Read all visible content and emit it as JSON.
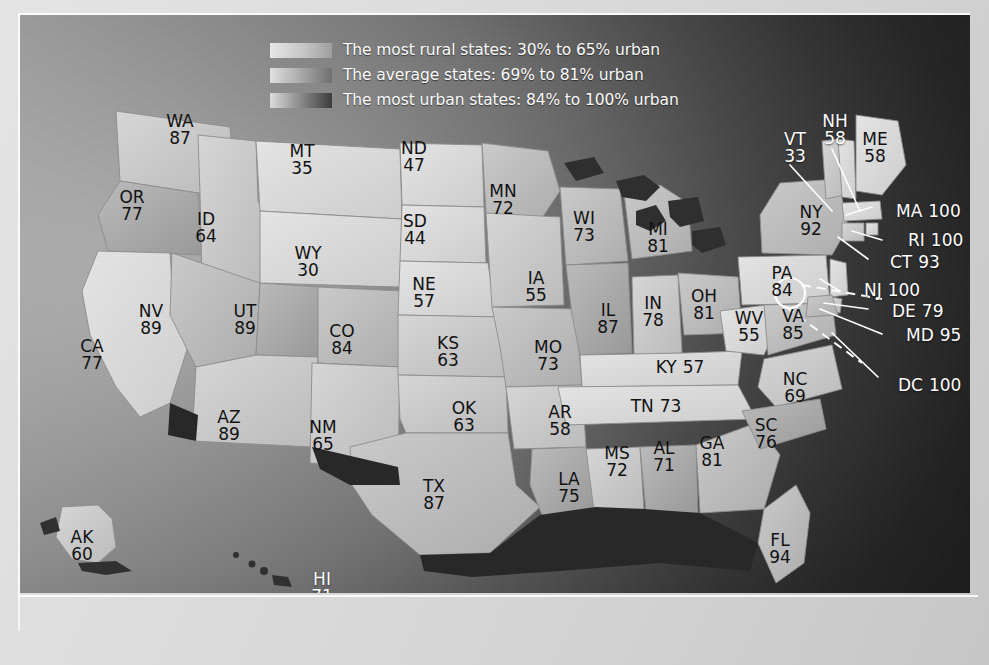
{
  "figure": {
    "type": "choropleth-map"
  },
  "legend": {
    "items": [
      {
        "swatch": "rural-gradient-swatch",
        "label": "The most rural states: 30% to 65% urban"
      },
      {
        "swatch": "average-gradient-swatch",
        "label": "The average states: 69% to 81% urban"
      },
      {
        "swatch": "urban-gradient-swatch",
        "label": "The most urban states: 84% to 100% urban"
      }
    ]
  },
  "states": [
    {
      "code": "WA",
      "value": "87",
      "x": 160,
      "y": 115,
      "style": "stack",
      "color": "dark"
    },
    {
      "code": "OR",
      "value": "77",
      "x": 112,
      "y": 191,
      "style": "stack",
      "color": "dark"
    },
    {
      "code": "ID",
      "value": "64",
      "x": 186,
      "y": 213,
      "style": "stack",
      "color": "dark"
    },
    {
      "code": "MT",
      "value": "35",
      "x": 282,
      "y": 145,
      "style": "stack",
      "color": "dark"
    },
    {
      "code": "WY",
      "value": "30",
      "x": 288,
      "y": 247,
      "style": "stack",
      "color": "dark"
    },
    {
      "code": "NV",
      "value": "89",
      "x": 131,
      "y": 305,
      "style": "stack",
      "color": "dark"
    },
    {
      "code": "UT",
      "value": "89",
      "x": 225,
      "y": 305,
      "style": "stack",
      "color": "dark"
    },
    {
      "code": "CA",
      "value": "77",
      "x": 72,
      "y": 340,
      "style": "stack",
      "color": "dark"
    },
    {
      "code": "AZ",
      "value": "89",
      "x": 209,
      "y": 411,
      "style": "stack",
      "color": "dark"
    },
    {
      "code": "NM",
      "value": "65",
      "x": 303,
      "y": 421,
      "style": "stack",
      "color": "dark"
    },
    {
      "code": "CO",
      "value": "84",
      "x": 322,
      "y": 325,
      "style": "stack",
      "color": "dark"
    },
    {
      "code": "ND",
      "value": "47",
      "x": 394,
      "y": 142,
      "style": "stack",
      "color": "dark"
    },
    {
      "code": "SD",
      "value": "44",
      "x": 395,
      "y": 215,
      "style": "stack",
      "color": "dark"
    },
    {
      "code": "NE",
      "value": "57",
      "x": 404,
      "y": 278,
      "style": "stack",
      "color": "dark"
    },
    {
      "code": "KS",
      "value": "63",
      "x": 428,
      "y": 337,
      "style": "stack",
      "color": "dark"
    },
    {
      "code": "OK",
      "value": "63",
      "x": 444,
      "y": 402,
      "style": "stack",
      "color": "dark"
    },
    {
      "code": "TX",
      "value": "87",
      "x": 414,
      "y": 480,
      "style": "stack",
      "color": "dark"
    },
    {
      "code": "MN",
      "value": "72",
      "x": 483,
      "y": 185,
      "style": "stack",
      "color": "dark"
    },
    {
      "code": "IA",
      "value": "55",
      "x": 516,
      "y": 272,
      "style": "stack",
      "color": "dark"
    },
    {
      "code": "MO",
      "value": "73",
      "x": 528,
      "y": 341,
      "style": "stack",
      "color": "dark"
    },
    {
      "code": "AR",
      "value": "58",
      "x": 540,
      "y": 406,
      "style": "stack",
      "color": "dark"
    },
    {
      "code": "LA",
      "value": "75",
      "x": 549,
      "y": 473,
      "style": "stack",
      "color": "dark"
    },
    {
      "code": "WI",
      "value": "73",
      "x": 564,
      "y": 212,
      "style": "stack",
      "color": "dark"
    },
    {
      "code": "IL",
      "value": "87",
      "x": 588,
      "y": 304,
      "style": "stack",
      "color": "dark"
    },
    {
      "code": "MS",
      "value": "72",
      "x": 597,
      "y": 447,
      "style": "stack",
      "color": "dark"
    },
    {
      "code": "MI",
      "value": "81",
      "x": 638,
      "y": 223,
      "style": "stack",
      "color": "dark"
    },
    {
      "code": "IN",
      "value": "78",
      "x": 633,
      "y": 297,
      "style": "stack",
      "color": "dark"
    },
    {
      "code": "AL",
      "value": "71",
      "x": 644,
      "y": 442,
      "style": "stack",
      "color": "dark"
    },
    {
      "code": "OH",
      "value": "81",
      "x": 684,
      "y": 290,
      "style": "stack",
      "color": "dark"
    },
    {
      "code": "KY",
      "value": "57",
      "x": 660,
      "y": 353,
      "style": "inline",
      "color": "dark"
    },
    {
      "code": "TN",
      "value": "73",
      "x": 636,
      "y": 392,
      "style": "inline",
      "color": "dark"
    },
    {
      "code": "GA",
      "value": "81",
      "x": 692,
      "y": 437,
      "style": "stack",
      "color": "dark"
    },
    {
      "code": "WV",
      "value": "55",
      "x": 729,
      "y": 312,
      "style": "stack",
      "color": "dark"
    },
    {
      "code": "VA",
      "value": "85",
      "x": 773,
      "y": 310,
      "style": "stack",
      "color": "dark"
    },
    {
      "code": "PA",
      "value": "84",
      "x": 762,
      "y": 267,
      "style": "stack",
      "color": "dark"
    },
    {
      "code": "NC",
      "value": "69",
      "x": 775,
      "y": 373,
      "style": "stack",
      "color": "dark"
    },
    {
      "code": "SC",
      "value": "76",
      "x": 746,
      "y": 419,
      "style": "stack",
      "color": "dark"
    },
    {
      "code": "FL",
      "value": "94",
      "x": 760,
      "y": 534,
      "style": "stack",
      "color": "dark"
    },
    {
      "code": "NY",
      "value": "92",
      "x": 791,
      "y": 206,
      "style": "stack",
      "color": "dark"
    },
    {
      "code": "ME",
      "value": "58",
      "x": 855,
      "y": 133,
      "style": "stack",
      "color": "dark"
    },
    {
      "code": "NH",
      "value": "58",
      "x": 815,
      "y": 115,
      "style": "stack",
      "color": "white"
    },
    {
      "code": "VT",
      "value": "33",
      "x": 775,
      "y": 133,
      "style": "stack",
      "color": "white"
    },
    {
      "code": "AK",
      "value": "60",
      "x": 62,
      "y": 531,
      "style": "stack",
      "color": "dark"
    },
    {
      "code": "HI",
      "value": "71",
      "x": 302,
      "y": 573,
      "style": "stack",
      "color": "white"
    }
  ],
  "callouts": [
    {
      "code": "MA",
      "value": "100",
      "x": 876,
      "y": 197
    },
    {
      "code": "RI",
      "value": "100",
      "x": 888,
      "y": 226
    },
    {
      "code": "CT",
      "value": "93",
      "x": 870,
      "y": 248
    },
    {
      "code": "NJ",
      "value": "100",
      "x": 844,
      "y": 276
    },
    {
      "code": "DE",
      "value": "79",
      "x": 872,
      "y": 297
    },
    {
      "code": "MD",
      "value": "95",
      "x": 886,
      "y": 321
    },
    {
      "code": "DC",
      "value": "100",
      "x": 878,
      "y": 371
    }
  ],
  "colors": {
    "label_dark": "#111111",
    "label_white": "#ffffff",
    "ocean_dark": "#262626",
    "paper": "#dcdcdc"
  }
}
